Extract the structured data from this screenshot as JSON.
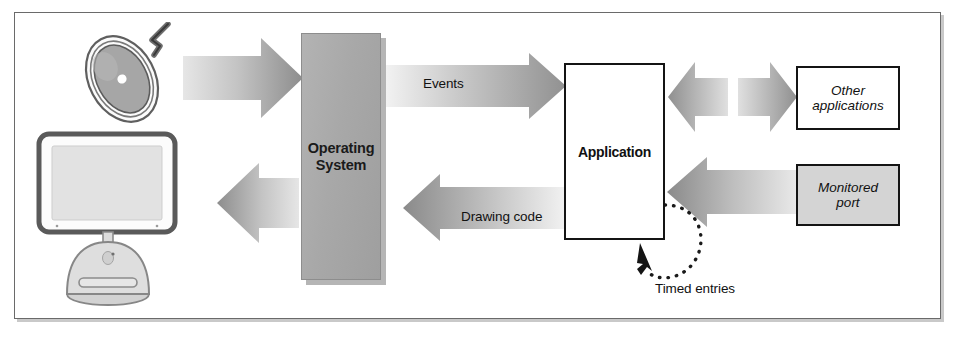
{
  "figure": {
    "kind": "architecture-block-diagram",
    "caption": "",
    "frame_border_color": "#6a6a6a",
    "background": "#ffffff"
  },
  "nodes": {
    "operating_system": {
      "label": "Operating\nSystem",
      "label_line1": "Operating",
      "label_line2": "System",
      "fill": "#a9a9a9",
      "style": "solid gray block with drop shadow"
    },
    "application": {
      "label": "Application",
      "fill": "#ffffff",
      "style": "white box, heavy black border, drop shadow"
    },
    "other_applications": {
      "label": "Other applications",
      "label_line1": "Other",
      "label_line2": "applications",
      "fill": "#ffffff",
      "style": "white box, heavy black border, italic label"
    },
    "monitored_port": {
      "label": "Monitored port",
      "label_line1": "Monitored",
      "label_line2": "port",
      "fill": "#d4d4d4",
      "style": "gray box, heavy black border, italic label"
    }
  },
  "devices": {
    "mouse": {
      "name": "mouse",
      "description": "round puck mouse tilted with cable"
    },
    "monitor": {
      "name": "display",
      "description": "flat panel display on dome base"
    }
  },
  "arrows": [
    {
      "id": "mouse-to-os",
      "label": "",
      "from": "mouse",
      "to": "operating_system",
      "direction": "right"
    },
    {
      "id": "os-to-app",
      "label": "Events",
      "from": "operating_system",
      "to": "application",
      "direction": "right"
    },
    {
      "id": "app-to-os",
      "label": "Drawing code",
      "from": "application",
      "to": "operating_system",
      "direction": "left"
    },
    {
      "id": "os-to-monitor",
      "label": "",
      "from": "operating_system",
      "to": "monitor",
      "direction": "left"
    },
    {
      "id": "other-apps-to-app",
      "label": "",
      "from": "other_applications",
      "to": "application",
      "direction": "left"
    },
    {
      "id": "app-to-other-apps",
      "label": "",
      "from": "application",
      "to": "other_applications",
      "direction": "right"
    },
    {
      "id": "port-to-app",
      "label": "",
      "from": "monitored_port",
      "to": "application",
      "direction": "left"
    },
    {
      "id": "timed-entries-loop",
      "label": "Timed entries",
      "from": "application",
      "to": "application",
      "direction": "dotted-loop"
    }
  ],
  "captions": {
    "events": "Events",
    "drawing_code": "Drawing code",
    "timed_entries": "Timed entries"
  },
  "colors": {
    "arrow_light": "#dcdcdc",
    "arrow_dark": "#8b8b8b",
    "block_gray": "#a9a9a9",
    "port_gray": "#d4d4d4",
    "text": "#111111",
    "border": "#141414"
  }
}
